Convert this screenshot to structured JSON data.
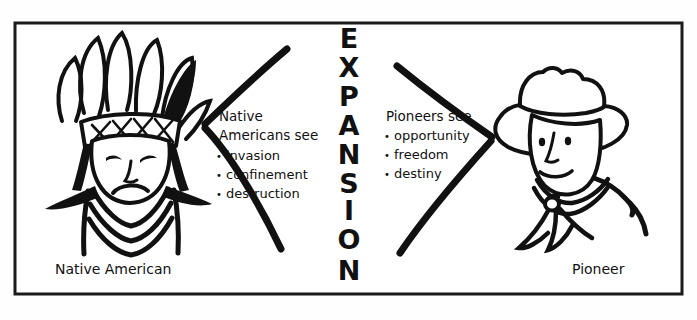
{
  "diagram": {
    "title_vertical": "EXPANSION",
    "title_letters": [
      "E",
      "X",
      "P",
      "A",
      "N",
      "S",
      "I",
      "O",
      "N"
    ],
    "frame": {
      "border_color": "#1a1a1a",
      "background_color": "#ffffff"
    },
    "ink_color": "#111111"
  },
  "left": {
    "figure_name": "native-american-figure",
    "caption": "Native American",
    "heading_line1": "Native",
    "heading_line2": "Americans see",
    "bullets": [
      "invasion",
      "confinement",
      "destruction"
    ],
    "bullet_glyph": "•"
  },
  "right": {
    "figure_name": "pioneer-figure",
    "caption": "Pioneer",
    "heading_line1": "Pioneers see",
    "bullets": [
      "opportunity",
      "freedom",
      "destiny"
    ],
    "bullet_glyph": "•"
  }
}
